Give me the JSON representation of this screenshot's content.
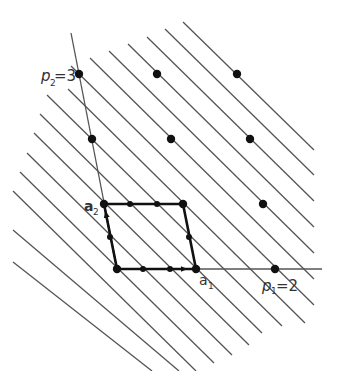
{
  "diagram": {
    "type": "lattice-fundamental-domain",
    "colors": {
      "background": "#ffffff",
      "lines": "#555555",
      "parallelogram": "#111111",
      "dots": "#111111",
      "text": "#333333"
    },
    "origin": [
      117,
      269
    ],
    "basis": {
      "a1": [
        79,
        0
      ],
      "a2": [
        -13,
        -65
      ]
    },
    "line_spacing_x": 26.3,
    "line_slope": 0.98,
    "labels": {
      "a1": "a",
      "a1_sub": "1",
      "a2": "a",
      "a2_sub": "2",
      "p1": "p",
      "p1_sub": "1",
      "p1_eq": "=2",
      "p2": "p",
      "p2_sub": "2",
      "p2_eq": "=3"
    },
    "lattice_points": [
      [
        79,
        74
      ],
      [
        157,
        74
      ],
      [
        237,
        74
      ],
      [
        92,
        139
      ],
      [
        171,
        139
      ],
      [
        250,
        139
      ],
      [
        104,
        204
      ],
      [
        183,
        204
      ],
      [
        263,
        204
      ],
      [
        117,
        269
      ],
      [
        196,
        269
      ],
      [
        275,
        269
      ]
    ],
    "parallelogram_corners": [
      [
        117,
        269
      ],
      [
        196,
        269
      ],
      [
        183,
        204
      ],
      [
        104,
        204
      ]
    ],
    "edge_points": [
      [
        143,
        269
      ],
      [
        170,
        269
      ],
      [
        130,
        204
      ],
      [
        157,
        204
      ],
      [
        110,
        237
      ],
      [
        189,
        237
      ]
    ],
    "family_lines": [
      {
        "x1": 183,
        "y1": 22,
        "x2": 314,
        "y2": 150
      },
      {
        "x1": 165,
        "y1": 29,
        "x2": 314,
        "y2": 175
      },
      {
        "x1": 147,
        "y1": 37,
        "x2": 314,
        "y2": 201
      },
      {
        "x1": 128,
        "y1": 44,
        "x2": 314,
        "y2": 227
      },
      {
        "x1": 109,
        "y1": 51,
        "x2": 314,
        "y2": 253
      },
      {
        "x1": 90,
        "y1": 58,
        "x2": 314,
        "y2": 279
      },
      {
        "x1": 71,
        "y1": 66,
        "x2": 314,
        "y2": 305
      },
      {
        "x1": 68,
        "y1": 89,
        "x2": 305,
        "y2": 323
      },
      {
        "x1": 47,
        "y1": 95,
        "x2": 282,
        "y2": 326
      },
      {
        "x1": 40,
        "y1": 114,
        "x2": 262,
        "y2": 333
      },
      {
        "x1": 34,
        "y1": 133,
        "x2": 249,
        "y2": 345
      },
      {
        "x1": 27,
        "y1": 153,
        "x2": 232,
        "y2": 355
      },
      {
        "x1": 20,
        "y1": 172,
        "x2": 214,
        "y2": 363
      },
      {
        "x1": 13,
        "y1": 191,
        "x2": 196,
        "y2": 371
      },
      {
        "x1": 13,
        "y1": 230,
        "x2": 179,
        "y2": 371
      },
      {
        "x1": 13,
        "y1": 262,
        "x2": 152,
        "y2": 371
      }
    ],
    "axis_lines": [
      {
        "name": "a1-axis",
        "x1": 117,
        "y1": 269,
        "x2": 322,
        "y2": 269
      },
      {
        "name": "a2-axis",
        "x1": 71,
        "y1": 33,
        "x2": 117,
        "y2": 269
      }
    ],
    "arrows": [
      {
        "name": "a1-arrow",
        "from": [
          117,
          269
        ],
        "to": [
          196,
          269
        ]
      },
      {
        "name": "a2-arrow",
        "from": [
          117,
          269
        ],
        "to": [
          104,
          204
        ]
      }
    ]
  }
}
